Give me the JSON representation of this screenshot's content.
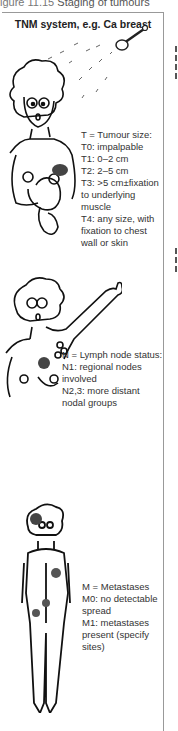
{
  "caption": {
    "prefix": "igure 11.15 ",
    "title": "Staging of tumours"
  },
  "panel": {
    "title": "TNM system, e.g. Ca breast",
    "sections": [
      {
        "id": "tumour",
        "lines": [
          "T = Tumour size:",
          "T0: impalpable",
          "T1: 0–2 cm",
          "T2: 2–5 cm",
          "T3: >5 cm±fixation",
          "to underlying",
          "muscle",
          "T4: any size, with",
          "fixation to chest",
          "wall or skin"
        ]
      },
      {
        "id": "nodes",
        "lines": [
          "N = Lymph node status:",
          "N1: regional nodes",
          "involved",
          "N2,3: more distant",
          "nodal groups"
        ]
      },
      {
        "id": "metastases",
        "lines": [
          "M = Metastases",
          "M0: no detectable",
          "spread",
          "M1: metastases",
          "present (specify",
          "sites)"
        ]
      }
    ]
  },
  "illustrations": [
    {
      "name": "woman-self-examining-breast-icon",
      "description": "cartoon woman palpating breast lump under shower head"
    },
    {
      "name": "woman-raised-arm-axillary-nodes-icon",
      "description": "cartoon woman with raised arm showing axillary lymph nodes"
    },
    {
      "name": "body-metastases-icon",
      "description": "cartoon full body with shaded metastatic sites"
    }
  ]
}
